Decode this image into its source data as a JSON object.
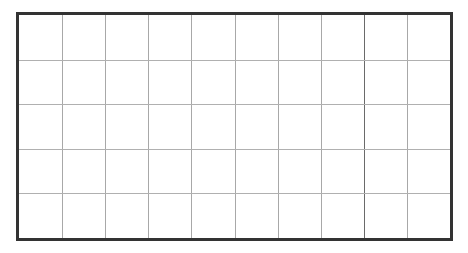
{
  "grid": {
    "columns": 10,
    "rows": 5,
    "border_color": "#333333",
    "line_color": "#a8a8a8",
    "emphasized_column_line": 8
  }
}
